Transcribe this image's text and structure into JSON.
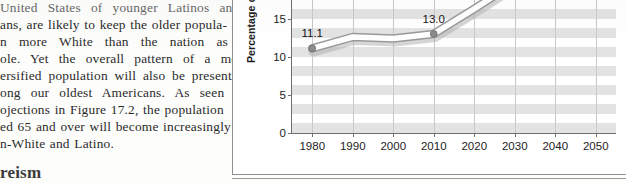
{
  "page": {
    "width": 626,
    "height": 183,
    "background": "#fdfdfc"
  },
  "text_column": {
    "lines": [
      "United States of younger Latinos and",
      "ans, are likely to keep the older popula-",
      "n more White than the nation as a",
      "ole. Yet the overall pattern of a more",
      "ersified population will also be present",
      "ong our oldest Americans. As seen in",
      "ojections in Figure 17.2, the population",
      "ed 65 and over will become increasingly",
      "n-White and Latino."
    ],
    "section_heading": "reism"
  },
  "figure": {
    "y_axis_title": "Percentage over 6",
    "border_color": "#8e8e8e"
  },
  "chart_data": {
    "type": "line",
    "title": "",
    "xlabel": "",
    "ylabel": "Percentage over 65",
    "x": [
      1980,
      1990,
      2000,
      2010,
      2020,
      2030,
      2040,
      2050
    ],
    "xticklabels": [
      "1980",
      "1990",
      "2000",
      "2010",
      "2020",
      "2030",
      "2040",
      "2050"
    ],
    "yticklabels": [
      "0",
      "5",
      "10",
      "15"
    ],
    "ytickvalues": [
      0,
      5,
      10,
      15
    ],
    "xlim": [
      1975,
      2055
    ],
    "ylim": [
      0,
      21
    ],
    "grid": "horizontal-bands-and-vertical-lines",
    "legend": "none",
    "series": [
      {
        "name": "Percentage of population age 65 and over",
        "values": [
          11.1,
          12.6,
          12.4,
          13.0,
          16.3,
          19.7,
          20.4,
          20.9
        ],
        "line_color": "#ffffff",
        "line_outline_color": "#9a9a9a",
        "marker_color": "#8c8c8c"
      }
    ],
    "point_labels": [
      {
        "x": 1980,
        "y": 11.1,
        "text": "11.1"
      },
      {
        "x": 2010,
        "y": 13.0,
        "text": "13.0"
      }
    ]
  }
}
